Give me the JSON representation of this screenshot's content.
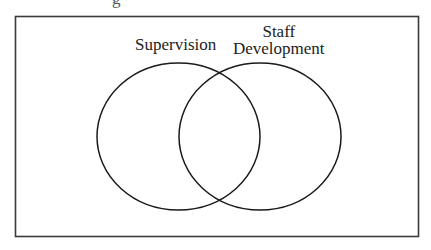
{
  "diagram": {
    "type": "venn",
    "sets": [
      {
        "name": "supervision",
        "label": "Supervision"
      },
      {
        "name": "staff-development",
        "label_lines": [
          "Staff",
          "Development"
        ]
      }
    ],
    "colors": {
      "stroke": "#1a1a1a",
      "frame": "#3a3a3a",
      "background": "#ffffff"
    }
  }
}
